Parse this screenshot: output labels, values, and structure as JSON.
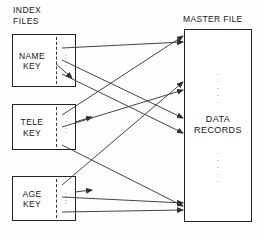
{
  "diagram": {
    "index_label": "INDEX\nFILES",
    "master_label": "MASTER FILE",
    "master_content": "DATA\nRECORDS",
    "vertical_ellipsis": "·",
    "index_boxes": [
      {
        "id": "name",
        "label": "NAME\nKEY"
      },
      {
        "id": "tele",
        "label": "TELE\nKEY"
      },
      {
        "id": "age",
        "label": "AGE\nKEY"
      }
    ],
    "colors": {
      "stroke": "#242424",
      "line": "#3a3a3a",
      "background": "#ffffff",
      "text": "#161616"
    }
  }
}
